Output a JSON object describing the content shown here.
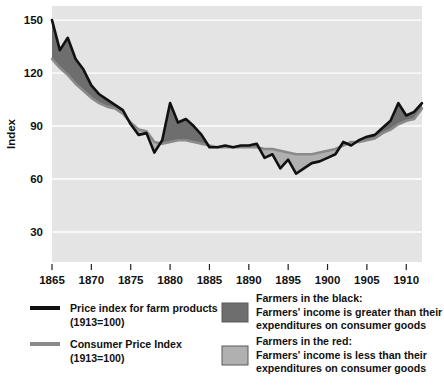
{
  "chart_data": {
    "type": "area",
    "title": "",
    "xlabel": "",
    "ylabel": "Index",
    "xlim": [
      1865,
      1912
    ],
    "ylim": [
      13,
      158
    ],
    "grid": true,
    "grid_color": "#ffffff",
    "plot_background": "#e4e4e4",
    "legend_position": "below-plot",
    "xticks": [
      1865,
      1870,
      1875,
      1880,
      1885,
      1890,
      1895,
      1900,
      1905,
      1910
    ],
    "yticks": [
      30,
      60,
      90,
      120,
      150
    ],
    "x": [
      1865,
      1866,
      1867,
      1868,
      1869,
      1870,
      1871,
      1872,
      1873,
      1874,
      1875,
      1876,
      1877,
      1878,
      1879,
      1880,
      1881,
      1882,
      1883,
      1884,
      1885,
      1886,
      1887,
      1888,
      1889,
      1890,
      1891,
      1892,
      1893,
      1894,
      1895,
      1896,
      1897,
      1898,
      1899,
      1900,
      1901,
      1902,
      1903,
      1904,
      1905,
      1906,
      1907,
      1908,
      1909,
      1910,
      1911,
      1912
    ],
    "series": [
      {
        "name": "Price index for farm products (1913=100)",
        "color": "#111111",
        "values": [
          150,
          133,
          140,
          128,
          122,
          113,
          108,
          105,
          102,
          99,
          91,
          85,
          86,
          75,
          82,
          103,
          92,
          94,
          90,
          85,
          78,
          78,
          79,
          78,
          79,
          79,
          80,
          72,
          74,
          66,
          71,
          63,
          66,
          69,
          70,
          72,
          74,
          81,
          79,
          82,
          84,
          85,
          89,
          93,
          103,
          96,
          98,
          103
        ]
      },
      {
        "name": "Consumer Price Index (1913=100)",
        "color": "#8a8a8a",
        "values": [
          128,
          123,
          119,
          114,
          110,
          106,
          103,
          101,
          100,
          97,
          92,
          88,
          87,
          81,
          80,
          81,
          82,
          82,
          81,
          80,
          79,
          78,
          78,
          78,
          78,
          78,
          78,
          77,
          77,
          76,
          75,
          74,
          74,
          74,
          75,
          76,
          77,
          79,
          81,
          81,
          82,
          83,
          86,
          88,
          91,
          93,
          94,
          100
        ]
      }
    ],
    "fills": [
      {
        "name": "Farmers in the black",
        "color": "#6e6e6e",
        "condition": "farm_products above consumer_price_index"
      },
      {
        "name": "Farmers in the red",
        "color": "#b0b0b0",
        "condition": "farm_products below consumer_price_index"
      }
    ]
  },
  "legend": {
    "line_entries": [
      {
        "swatch": "black-line-swatch",
        "line1": "Price index for farm products",
        "line2": "(1913=100)",
        "color": "#111111"
      },
      {
        "swatch": "gray-line-swatch",
        "line1": "Consumer Price Index",
        "line2": "(1913=100)",
        "color": "#8a8a8a"
      }
    ],
    "fill_entries": [
      {
        "swatch": "dark-gray-fill-swatch",
        "color": "#6e6e6e",
        "line1": "Farmers in the black:",
        "line2": "Farmers' income is greater than their",
        "line3": "expenditures on consumer goods"
      },
      {
        "swatch": "light-gray-fill-swatch",
        "color": "#b0b0b0",
        "line1": "Farmers in the red:",
        "line2": "Farmers' income is less than their",
        "line3": "expenditures on consumer goods"
      }
    ]
  }
}
